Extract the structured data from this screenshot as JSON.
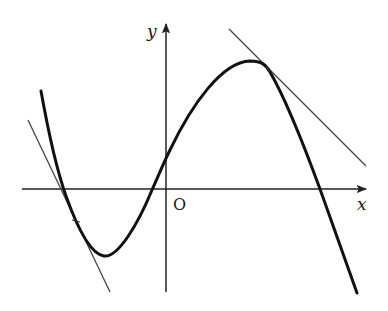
{
  "figure": {
    "type": "function-graph-with-tangents",
    "labels": {
      "y_axis": "y",
      "x_axis": "x",
      "origin": "O"
    },
    "colors": {
      "curve": "#111111",
      "axis": "#222222",
      "tangent": "#444444",
      "background": "#ffffff"
    },
    "axes": {
      "origin_px": [
        166,
        189
      ],
      "x_axis_from": [
        22,
        189
      ],
      "x_axis_to": [
        368,
        189
      ],
      "y_axis_from": [
        166,
        292
      ],
      "y_axis_to": [
        166,
        22
      ]
    },
    "curve_points_px": [
      [
        41,
        91
      ],
      [
        64,
        189
      ],
      [
        76,
        221
      ],
      [
        104,
        256
      ],
      [
        152,
        189
      ],
      [
        166,
        172
      ],
      [
        250,
        61
      ],
      [
        268,
        69
      ],
      [
        320,
        189
      ],
      [
        357,
        293
      ]
    ],
    "tangent_lines": [
      {
        "name": "left-tangent",
        "from": [
          28,
          120
        ],
        "to": [
          110,
          292
        ],
        "touch_point": [
          76,
          221
        ]
      },
      {
        "name": "right-tangent",
        "from": [
          229,
          29
        ],
        "to": [
          366,
          166
        ],
        "touch_point": [
          268,
          69
        ]
      }
    ]
  }
}
